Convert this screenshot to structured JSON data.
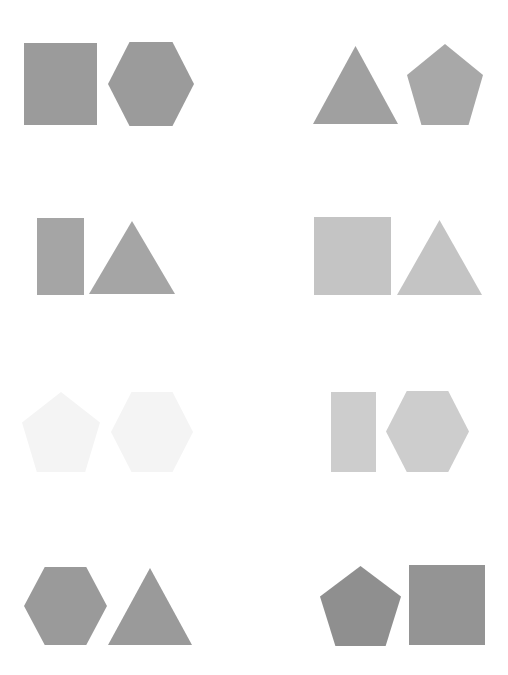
{
  "canvas": {
    "width": 508,
    "height": 675,
    "background_color": "#ffffff",
    "layout": "4 rows x 2 columns of shape-pair panels",
    "panel_count": 8
  },
  "palette": {
    "medium_gray": "#9b9b9b",
    "light_gray": "#c4c4c4",
    "pale_gray": "#cdcdcd",
    "near_white": "#f4f4f4",
    "background": "#ffffff"
  },
  "panels": [
    {
      "id": "panel-r1c1",
      "row": 1,
      "column": 1,
      "shapes": [
        {
          "name": "square",
          "type": "square",
          "color": "#9b9b9b",
          "x": 24,
          "y": 43,
          "width": 73,
          "height": 82
        },
        {
          "name": "hexagon",
          "type": "hexagon",
          "color": "#9b9b9b",
          "x": 108,
          "y": 42,
          "width": 86,
          "height": 84
        }
      ]
    },
    {
      "id": "panel-r1c2",
      "row": 1,
      "column": 2,
      "shapes": [
        {
          "name": "triangle",
          "type": "triangle",
          "color": "#a0a0a0",
          "x": 313,
          "y": 46,
          "width": 85,
          "height": 78
        },
        {
          "name": "pentagon",
          "type": "pentagon",
          "color": "#a8a8a8",
          "x": 407,
          "y": 44,
          "width": 76,
          "height": 81
        }
      ]
    },
    {
      "id": "panel-r2c1",
      "row": 2,
      "column": 1,
      "shapes": [
        {
          "name": "rectangle",
          "type": "rectangle",
          "color": "#a5a5a5",
          "x": 37,
          "y": 218,
          "width": 47,
          "height": 77
        },
        {
          "name": "triangle",
          "type": "triangle",
          "color": "#a5a5a5",
          "x": 89,
          "y": 221,
          "width": 86,
          "height": 73
        }
      ]
    },
    {
      "id": "panel-r2c2",
      "row": 2,
      "column": 2,
      "shapes": [
        {
          "name": "square",
          "type": "square",
          "color": "#c4c4c4",
          "x": 314,
          "y": 217,
          "width": 77,
          "height": 78
        },
        {
          "name": "triangle",
          "type": "triangle",
          "color": "#c4c4c4",
          "x": 397,
          "y": 220,
          "width": 85,
          "height": 75
        }
      ]
    },
    {
      "id": "panel-r3c1",
      "row": 3,
      "column": 1,
      "shapes": [
        {
          "name": "pentagon",
          "type": "pentagon",
          "color": "#f4f4f4",
          "x": 22,
          "y": 392,
          "width": 78,
          "height": 80
        },
        {
          "name": "hexagon",
          "type": "hexagon",
          "color": "#f4f4f4",
          "x": 111,
          "y": 392,
          "width": 82,
          "height": 80
        }
      ]
    },
    {
      "id": "panel-r3c2",
      "row": 3,
      "column": 2,
      "shapes": [
        {
          "name": "rectangle",
          "type": "rectangle",
          "color": "#cdcdcd",
          "x": 331,
          "y": 392,
          "width": 45,
          "height": 80
        },
        {
          "name": "hexagon",
          "type": "hexagon",
          "color": "#cdcdcd",
          "x": 386,
          "y": 391,
          "width": 83,
          "height": 81
        }
      ]
    },
    {
      "id": "panel-r4c1",
      "row": 4,
      "column": 1,
      "shapes": [
        {
          "name": "hexagon",
          "type": "hexagon",
          "color": "#9a9a9a",
          "x": 24,
          "y": 567,
          "width": 83,
          "height": 78
        },
        {
          "name": "triangle",
          "type": "triangle",
          "color": "#9a9a9a",
          "x": 108,
          "y": 568,
          "width": 84,
          "height": 77
        }
      ]
    },
    {
      "id": "panel-r4c2",
      "row": 4,
      "column": 2,
      "shapes": [
        {
          "name": "pentagon",
          "type": "pentagon",
          "color": "#8f8f8f",
          "x": 320,
          "y": 566,
          "width": 81,
          "height": 80
        },
        {
          "name": "square",
          "type": "square",
          "color": "#949494",
          "x": 409,
          "y": 565,
          "width": 76,
          "height": 80
        }
      ]
    }
  ]
}
